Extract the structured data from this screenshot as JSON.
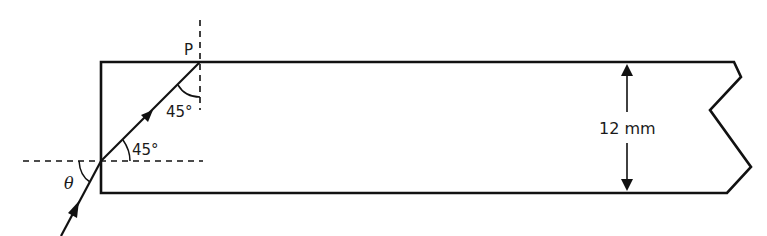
{
  "diagram": {
    "type": "optics-refraction-block",
    "labels": {
      "point": "P",
      "angle_at_p": "45°",
      "angle_refracted": "45°",
      "angle_incident": "θ",
      "thickness": "12 mm"
    },
    "elements": [
      "glass block (rectangle with broken right edge)",
      "incident ray with arrow",
      "refracted ray inside block with arrow",
      "horizontal dashed normal at entry point",
      "vertical dashed normal at point P",
      "double-headed dimension arrow"
    ],
    "colors": {
      "stroke": "#111111",
      "background": "#ffffff"
    }
  }
}
